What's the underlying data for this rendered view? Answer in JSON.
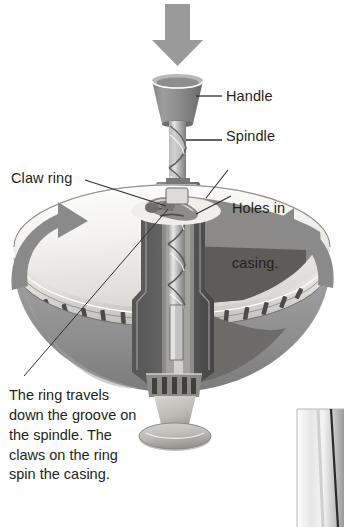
{
  "figure": {
    "title_alt": "Cutaway diagram of a spinning top toy",
    "colors": {
      "background": "#ffffff",
      "ink": "#231f20",
      "arrow_gray": "#8a8a8a",
      "body_light": "#eceae6",
      "body_mid": "#9e9e9e",
      "body_dark": "#6e6e6e",
      "body_darker": "#565656",
      "metal_light": "#d8d8d8",
      "metal_mid": "#a8a8a8",
      "leader_line": "#3a3a3a"
    }
  },
  "labels": {
    "handle": "Handle",
    "spindle": "Spindle",
    "claw_ring": "Claw ring",
    "holes_in_casing_line1": "Holes in",
    "holes_in_casing_line2": "casing."
  },
  "caption": {
    "text": "The ring travels down the groove on the spindle. The claws on the ring spin the casing."
  },
  "icons": {
    "push_arrow": "down-arrow-icon",
    "rotation_left": "rotate-arrow-left-icon",
    "rotation_right": "rotate-arrow-right-icon"
  }
}
